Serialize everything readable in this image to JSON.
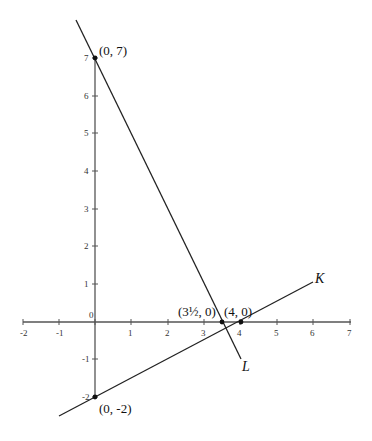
{
  "diagram": {
    "x_axis": {
      "ticks": [
        {
          "value": -2,
          "label": "-2",
          "px": 23
        },
        {
          "value": -1,
          "label": "-1",
          "px": 59
        },
        {
          "value": 0,
          "label": "",
          "px": 95
        },
        {
          "value": 1,
          "label": "1",
          "px": 131
        },
        {
          "value": 2,
          "label": "2",
          "px": 168
        },
        {
          "value": 3,
          "label": "3",
          "px": 204
        },
        {
          "value": 4,
          "label": "4",
          "px": 240
        },
        {
          "value": 5,
          "label": "5",
          "px": 277
        },
        {
          "value": 6,
          "label": "6",
          "px": 313
        },
        {
          "value": 7,
          "label": "7",
          "px": 350
        }
      ]
    },
    "y_axis": {
      "ticks": [
        {
          "value": 7,
          "label": "7",
          "py": 58
        },
        {
          "value": 6,
          "label": "6",
          "py": 96
        },
        {
          "value": 5,
          "label": "5",
          "py": 133
        },
        {
          "value": 4,
          "label": "4",
          "py": 171
        },
        {
          "value": 3,
          "label": "3",
          "py": 209
        },
        {
          "value": 2,
          "label": "2",
          "py": 246
        },
        {
          "value": 1,
          "label": "1",
          "py": 284
        },
        {
          "value": -1,
          "label": "-1",
          "py": 359
        },
        {
          "value": -2,
          "label": "-2",
          "py": 397
        }
      ]
    },
    "origin_label": "0",
    "lines": {
      "L": {
        "label": "L",
        "through": [
          "(0, 7)",
          "(3½, 0)"
        ]
      },
      "K": {
        "label": "K",
        "through": [
          "(0, -2)",
          "(4, 0)"
        ]
      }
    },
    "points": {
      "p07": "(0, 7)",
      "p0m2": "(0, -2)",
      "p35": "(3½, 0)",
      "p40": "(4, 0)"
    },
    "colors": {
      "stroke": "#333333",
      "text": "#111111"
    }
  }
}
